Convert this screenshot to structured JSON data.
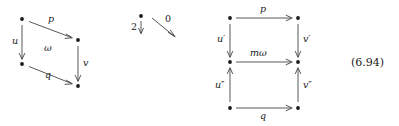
{
  "figure": {
    "equation_number": "(6.94)",
    "left_diagram": {
      "name": "left-square-diagram",
      "nodes": [
        {
          "id": "tl",
          "label": ""
        },
        {
          "id": "tr",
          "label": ""
        },
        {
          "id": "bl",
          "label": ""
        },
        {
          "id": "br",
          "label": ""
        }
      ],
      "arrows": [
        {
          "id": "p",
          "label": "p",
          "from": "tl",
          "to": "tr",
          "direction": "down-right"
        },
        {
          "id": "u",
          "label": "u",
          "from": "tl",
          "to": "bl",
          "direction": "down"
        },
        {
          "id": "v",
          "label": "v",
          "from": "tr",
          "to": "br",
          "direction": "down"
        },
        {
          "id": "q",
          "label": "q",
          "from": "bl",
          "to": "br",
          "direction": "down-right"
        }
      ],
      "center_label": "ω"
    },
    "middle_fragment": {
      "name": "middle-fragment",
      "vertical_label": "2",
      "diagonal_label": "0"
    },
    "right_diagram": {
      "name": "right-grid-diagram",
      "arrows": [
        {
          "id": "p",
          "label": "p",
          "direction": "right",
          "row": "top"
        },
        {
          "id": "momega",
          "label": "mω",
          "direction": "right",
          "row": "middle"
        },
        {
          "id": "q",
          "label": "q",
          "direction": "right",
          "row": "bottom"
        },
        {
          "id": "uprime",
          "label": "u′",
          "direction": "down",
          "column": "left"
        },
        {
          "id": "udprime",
          "label": "u″",
          "direction": "up",
          "column": "left"
        },
        {
          "id": "vprime",
          "label": "v′",
          "direction": "down",
          "column": "right"
        },
        {
          "id": "vdprime",
          "label": "v″",
          "direction": "up",
          "column": "right"
        }
      ]
    }
  }
}
